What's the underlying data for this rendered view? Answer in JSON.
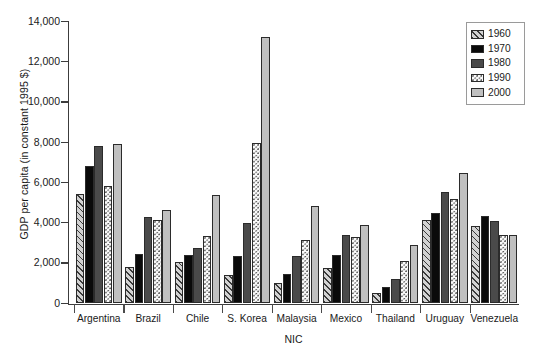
{
  "chart_data": {
    "type": "bar",
    "title": "",
    "xlabel": "NIC",
    "ylabel": "GDP per capita (in constant 1995 $)",
    "ylim": [
      0,
      14000
    ],
    "ytick_labels": [
      "0",
      "2,000",
      "4,000",
      "6,000",
      "8,000",
      "10,000",
      "12,000",
      "14,000"
    ],
    "ytick_values": [
      0,
      2000,
      4000,
      6000,
      8000,
      10000,
      12000,
      14000
    ],
    "grid": false,
    "legend_position": "top-right",
    "categories": [
      "Argentina",
      "Brazil",
      "Chile",
      "S. Korea",
      "Malaysia",
      "Mexico",
      "Thailand",
      "Uruguay",
      "Venezuela"
    ],
    "series": [
      {
        "name": "1960",
        "pattern": "diagonal-hatch",
        "color": "#d2d2d2",
        "values": [
          5400,
          1750,
          2000,
          1350,
          1000,
          1700,
          500,
          4100,
          3800
        ]
      },
      {
        "name": "1970",
        "pattern": "solid",
        "color": "#0a0a0a",
        "values": [
          6800,
          2400,
          2350,
          2300,
          1400,
          2350,
          800,
          4450,
          4300
        ]
      },
      {
        "name": "1980",
        "pattern": "solid",
        "color": "#4a4a4a",
        "values": [
          7800,
          4250,
          2700,
          3950,
          2300,
          3350,
          1150,
          5500,
          4050
        ]
      },
      {
        "name": "1990",
        "pattern": "stipple-dots",
        "color": "#fbfbfb",
        "values": [
          5800,
          4100,
          3300,
          7950,
          3100,
          3250,
          2050,
          5150,
          3350
        ]
      },
      {
        "name": "2000",
        "pattern": "solid",
        "color": "#c0c0c0",
        "values": [
          7900,
          4600,
          5350,
          13200,
          4800,
          3850,
          2850,
          6450,
          3350
        ]
      }
    ]
  },
  "legend": {
    "entries": [
      "1960",
      "1970",
      "1980",
      "1990",
      "2000"
    ]
  }
}
